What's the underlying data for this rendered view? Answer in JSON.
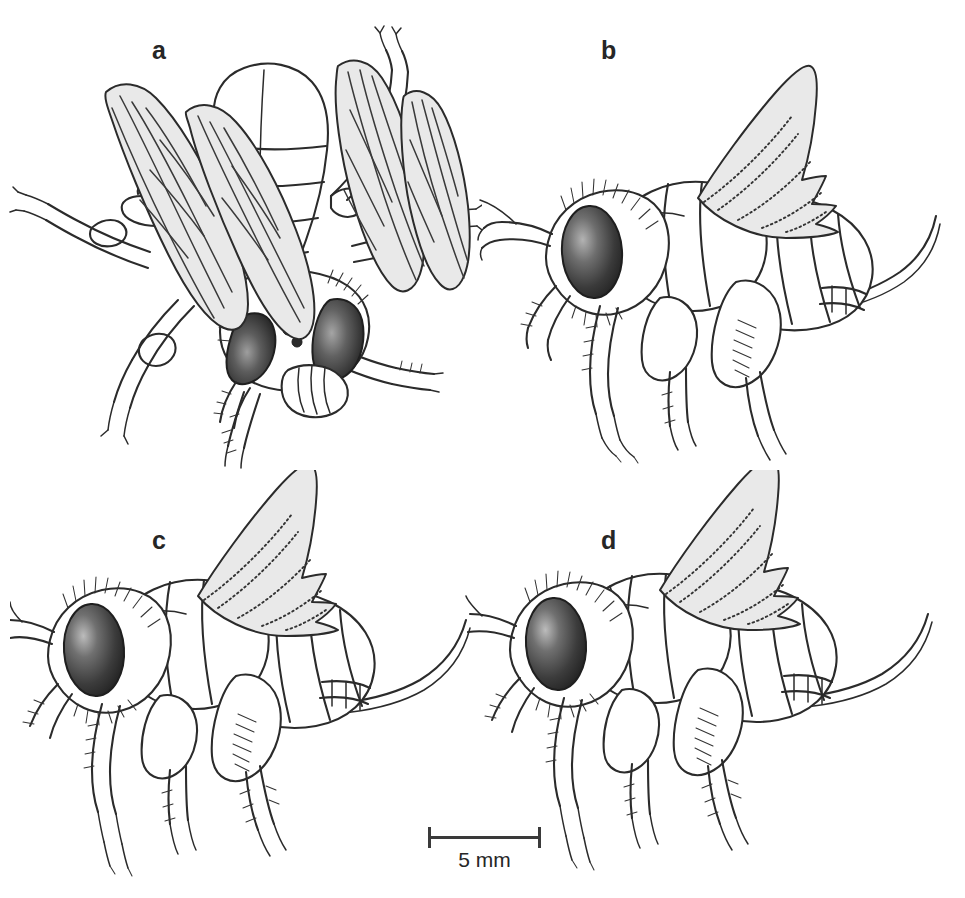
{
  "figure": {
    "type": "scientific-illustration-plate",
    "background_color": "#ffffff",
    "ink_color": "#2b2b2b",
    "wing_fill_color": "#e9e9e9",
    "eye_dark_color": "#2e2e2e",
    "eye_highlight_color": "#b9b9b9",
    "panel_count": 4
  },
  "panels": [
    {
      "id": "a",
      "label": "a",
      "view": "dorso-frontal view of fly with spread wings",
      "features": [
        "two compound eyes",
        "three ocelli",
        "two wings",
        "six legs",
        "antennae",
        "mouthparts"
      ]
    },
    {
      "id": "b",
      "label": "b",
      "view": "lateral view of fly with raised wing",
      "features": [
        "compound eye",
        "raised triangular wing",
        "segmented abdomen",
        "legs",
        "bristles"
      ]
    },
    {
      "id": "c",
      "label": "c",
      "view": "lateral view of fly with raised wing",
      "features": [
        "compound eye",
        "raised triangular wing",
        "segmented abdomen",
        "legs",
        "bristles"
      ]
    },
    {
      "id": "d",
      "label": "d",
      "view": "lateral view of fly with raised wing",
      "features": [
        "compound eye",
        "raised triangular wing",
        "segmented abdomen",
        "legs",
        "bristles"
      ]
    }
  ],
  "scalebar": {
    "label": "5 mm",
    "value": 5,
    "unit": "mm",
    "style": "horizontal bar with end ticks"
  }
}
